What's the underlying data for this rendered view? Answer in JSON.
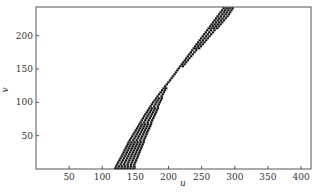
{
  "chart_data": {
    "type": "scatter",
    "title": "",
    "xlabel": "u",
    "ylabel": "v",
    "xlim": [
      0,
      415
    ],
    "ylim": [
      0,
      243
    ],
    "xticks": [
      50,
      100,
      150,
      200,
      250,
      300,
      350,
      400
    ],
    "yticks": [
      50,
      100,
      150,
      200
    ],
    "grid": false,
    "legend": null,
    "marker": "short horizontal dash",
    "marker_color": "#111111",
    "series": [
      {
        "name": "band",
        "points_band": [
          {
            "v": 2,
            "u_min": 118,
            "u_max": 150
          },
          {
            "v": 20,
            "u_min": 128,
            "u_max": 157
          },
          {
            "v": 40,
            "u_min": 138,
            "u_max": 165
          },
          {
            "v": 60,
            "u_min": 150,
            "u_max": 173
          },
          {
            "v": 80,
            "u_min": 162,
            "u_max": 182
          },
          {
            "v": 100,
            "u_min": 175,
            "u_max": 190
          },
          {
            "v": 120,
            "u_min": 190,
            "u_max": 198
          },
          {
            "v": 135,
            "u_min": 202,
            "u_max": 207
          },
          {
            "v": 150,
            "u_min": 213,
            "u_max": 220
          },
          {
            "v": 170,
            "u_min": 228,
            "u_max": 238
          },
          {
            "v": 190,
            "u_min": 243,
            "u_max": 257
          },
          {
            "v": 210,
            "u_min": 258,
            "u_max": 275
          },
          {
            "v": 230,
            "u_min": 273,
            "u_max": 293
          },
          {
            "v": 242,
            "u_min": 282,
            "u_max": 300
          }
        ]
      }
    ]
  },
  "axes": {
    "x_tick_labels": [
      "50",
      "100",
      "150",
      "200",
      "250",
      "300",
      "350",
      "400"
    ],
    "y_tick_labels": [
      "50",
      "100",
      "150",
      "200"
    ],
    "x_label": "u",
    "y_label": "v"
  }
}
